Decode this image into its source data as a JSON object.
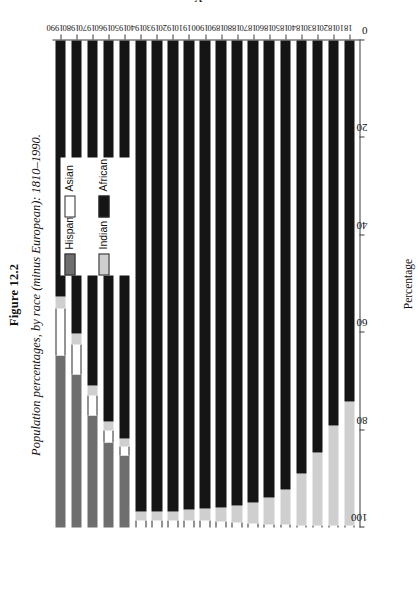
{
  "figure": {
    "number": "Figure 12.2",
    "caption": "Population percentages, by race (minus European): 1810–1990."
  },
  "chart_data": {
    "type": "bar",
    "orientation": "horizontal-stacked",
    "title": "Population percentages, by race (minus European): 1810–1990.",
    "xlabel": "Percentage",
    "ylabel": "Year",
    "xlim": [
      100,
      0
    ],
    "x_reversed": true,
    "xticks": [
      100,
      80,
      60,
      40,
      20,
      0
    ],
    "grid": false,
    "legend_position": "upper-right",
    "legend": [
      "Indian",
      "African",
      "Hispanic",
      "Asian"
    ],
    "stack_order": [
      "Hispanic",
      "Asian",
      "Indian",
      "African"
    ],
    "colors": {
      "Indian": "#cfcfcf",
      "African": "#151515",
      "Hispanic": "#6e6e6e",
      "Asian": "#ffffff"
    },
    "categories": [
      1990,
      1980,
      1970,
      1960,
      1950,
      1940,
      1930,
      1920,
      1910,
      1900,
      1890,
      1880,
      1870,
      1860,
      1850,
      1840,
      1830,
      1820,
      1810
    ],
    "series": [
      {
        "name": "Hispanic",
        "values": [
          35.4,
          31.4,
          23.1,
          17.5,
          14.8,
          0.0,
          0.0,
          0.0,
          0.0,
          0.0,
          0.0,
          0.0,
          0.0,
          0.0,
          0.0,
          0.0,
          0.0,
          0.0,
          0.0
        ]
      },
      {
        "name": "Asian",
        "values": [
          9.5,
          6.2,
          4.0,
          2.5,
          1.8,
          1.5,
          1.4,
          1.4,
          1.5,
          1.4,
          1.3,
          1.1,
          0.9,
          0.7,
          0.6,
          0.5,
          0.4,
          0.4,
          0.4
        ]
      },
      {
        "name": "Indian",
        "values": [
          2.5,
          2.2,
          2.0,
          1.8,
          1.6,
          1.8,
          1.8,
          1.9,
          2.1,
          2.4,
          2.8,
          3.4,
          4.2,
          5.4,
          7.2,
          10.5,
          15.0,
          20.5,
          25.5
        ]
      },
      {
        "name": "African",
        "values": [
          52.6,
          60.2,
          70.9,
          78.2,
          81.8,
          96.7,
          96.8,
          96.7,
          96.4,
          96.2,
          95.9,
          95.5,
          94.9,
          93.9,
          92.2,
          89.0,
          84.6,
          79.1,
          74.1
        ]
      }
    ]
  }
}
